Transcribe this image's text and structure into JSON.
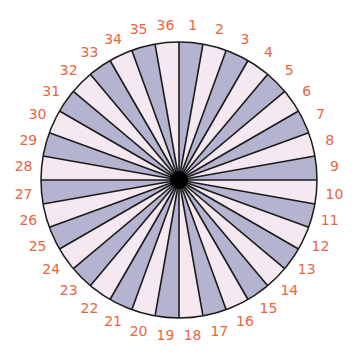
{
  "diagram": {
    "type": "numbered-sector-wheel",
    "sector_count": 36,
    "labels": [
      "1",
      "2",
      "3",
      "4",
      "5",
      "6",
      "7",
      "8",
      "9",
      "10",
      "11",
      "12",
      "13",
      "14",
      "15",
      "16",
      "17",
      "18",
      "19",
      "20",
      "21",
      "22",
      "23",
      "24",
      "25",
      "26",
      "27",
      "28",
      "29",
      "30",
      "31",
      "32",
      "33",
      "34",
      "35",
      "36"
    ],
    "center": [
      179,
      180
    ],
    "radius": 138,
    "label_radius": 156,
    "hub_radius": 9,
    "colors": {
      "odd_sector": "#b4b4d0",
      "even_sector": "#f6e8f0",
      "lines": "#1a1a1a",
      "hub": "#000000",
      "labels": "#e8653f"
    }
  }
}
